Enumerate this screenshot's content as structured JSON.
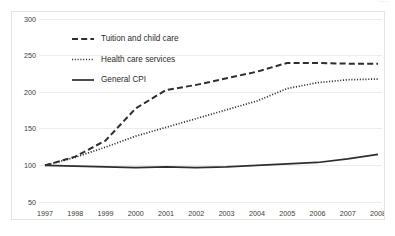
{
  "artifact": {
    "corner_mark": "---"
  },
  "chart_data": {
    "type": "line",
    "title": "",
    "subtitle": "",
    "xlabel": "",
    "ylabel": "",
    "x": [
      1997,
      1998,
      1999,
      2000,
      2001,
      2002,
      2003,
      2004,
      2005,
      2006,
      2007,
      2008
    ],
    "categories": [
      "1997",
      "1998",
      "1999",
      "2000",
      "2001",
      "2002",
      "2003",
      "2004",
      "2005",
      "2006",
      "2007",
      "2008"
    ],
    "xlim": [
      1997,
      2008
    ],
    "ylim": [
      50,
      300
    ],
    "yticks": [
      50,
      100,
      150,
      200,
      250,
      300
    ],
    "ytick_labels": [
      "50",
      "100",
      "150",
      "200",
      "250",
      "300"
    ],
    "grid": true,
    "grid_axis": "y",
    "legend_position": "upper-left-inside",
    "index_base": 100,
    "series": [
      {
        "name": "Tuition and child care",
        "style": "dashed",
        "color": "#2e2e2e",
        "values": [
          100,
          112,
          134,
          178,
          203,
          210,
          219,
          228,
          240,
          240,
          239,
          239
        ]
      },
      {
        "name": "Health care services",
        "style": "dotted",
        "color": "#2e2e2e",
        "values": [
          100,
          111,
          125,
          140,
          152,
          164,
          176,
          188,
          205,
          213,
          217,
          218
        ]
      },
      {
        "name": "General CPI",
        "style": "solid",
        "color": "#2e2e2e",
        "values": [
          100,
          99,
          98,
          97,
          98,
          97,
          98,
          100,
          102,
          104,
          109,
          115
        ]
      }
    ]
  },
  "legend": {
    "items": [
      {
        "label": "Tuition and child care",
        "style": "dashed"
      },
      {
        "label": "Health care services",
        "style": "dotted"
      },
      {
        "label": "General CPI",
        "style": "solid"
      }
    ]
  }
}
